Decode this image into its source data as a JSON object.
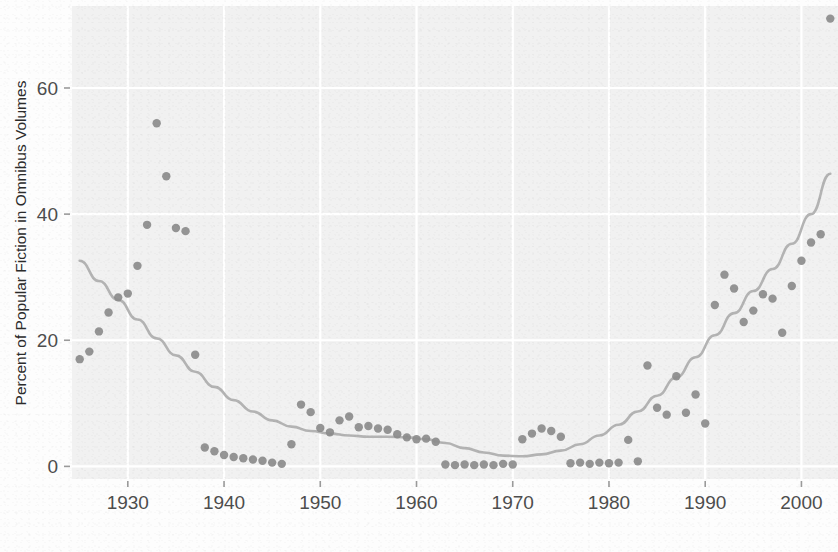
{
  "chart_data": {
    "type": "scatter",
    "title": "",
    "xlabel": "",
    "ylabel": "Percent of Popular Fiction in Omnibus Volumes",
    "xlim": [
      1924.2,
      2003.8
    ],
    "ylim": [
      -2.0,
      73.0
    ],
    "xticks": [
      1930,
      1940,
      1950,
      1960,
      1970,
      1980,
      1990,
      2000
    ],
    "xticklabels": [
      "1930",
      "1940",
      "1950",
      "1960",
      "1970",
      "1980",
      "1990",
      "2000"
    ],
    "yticks": [
      0,
      20,
      40,
      60
    ],
    "yticklabels": [
      "0",
      "20",
      "40",
      "60"
    ],
    "grid": true,
    "grid_color": "#ffffff",
    "panel_background": "#f0f0f0",
    "point_color": "#8c8c8c",
    "point_radius": 4.2,
    "legend": null,
    "series": [
      {
        "name": "Percent of popular fiction in omnibus volumes",
        "marker": "circle",
        "x": [
          1925,
          1926,
          1927,
          1928,
          1929,
          1930,
          1931,
          1932,
          1933,
          1934,
          1935,
          1936,
          1937,
          1938,
          1939,
          1940,
          1941,
          1942,
          1943,
          1944,
          1945,
          1946,
          1947,
          1948,
          1949,
          1950,
          1951,
          1952,
          1953,
          1954,
          1955,
          1956,
          1957,
          1958,
          1959,
          1960,
          1961,
          1962,
          1963,
          1964,
          1965,
          1966,
          1967,
          1968,
          1969,
          1970,
          1971,
          1972,
          1973,
          1974,
          1975,
          1976,
          1977,
          1978,
          1979,
          1980,
          1981,
          1982,
          1983,
          1984,
          1985,
          1986,
          1987,
          1988,
          1989,
          1990,
          1991,
          1992,
          1993,
          1994,
          1995,
          1996,
          1997,
          1998,
          1999,
          2000,
          2001,
          2002,
          2003
        ],
        "y": [
          17.0,
          18.2,
          21.4,
          24.4,
          26.8,
          27.4,
          31.8,
          38.3,
          54.4,
          46.0,
          37.8,
          37.3,
          17.7,
          3.0,
          2.4,
          1.8,
          1.5,
          1.3,
          1.1,
          0.9,
          0.6,
          0.4,
          3.5,
          9.8,
          8.6,
          6.1,
          5.4,
          7.3,
          7.9,
          6.2,
          6.4,
          6.0,
          5.8,
          5.1,
          4.6,
          4.3,
          4.4,
          3.9,
          0.3,
          0.2,
          0.3,
          0.2,
          0.3,
          0.2,
          0.4,
          0.3,
          4.3,
          5.2,
          6.0,
          5.6,
          4.7,
          0.5,
          0.6,
          0.4,
          0.6,
          0.5,
          0.6,
          4.2,
          0.8,
          16.0,
          9.3,
          8.2,
          14.3,
          8.5,
          11.4,
          6.8,
          25.6,
          30.4,
          28.2,
          22.9,
          24.7,
          27.3,
          26.6,
          21.2,
          28.6,
          32.6,
          35.5,
          36.8,
          71.0
        ]
      }
    ],
    "trend": {
      "name": "smoothed trend (loess)",
      "color": "#b3b3b3",
      "width": 2.6,
      "x": [
        1925,
        1927,
        1929,
        1931,
        1933,
        1935,
        1937,
        1939,
        1941,
        1943,
        1945,
        1947,
        1949,
        1951,
        1953,
        1955,
        1957,
        1959,
        1961,
        1963,
        1965,
        1967,
        1969,
        1971,
        1973,
        1975,
        1977,
        1979,
        1981,
        1983,
        1985,
        1987,
        1989,
        1991,
        1993,
        1995,
        1997,
        1999,
        2001,
        2003
      ],
      "y": [
        32.6,
        29.4,
        26.4,
        23.3,
        20.3,
        17.6,
        15.0,
        12.6,
        10.5,
        8.7,
        7.3,
        6.3,
        5.6,
        5.2,
        4.9,
        4.7,
        4.7,
        4.6,
        4.3,
        3.7,
        2.9,
        2.2,
        1.7,
        1.6,
        1.9,
        2.5,
        3.5,
        4.9,
        6.6,
        8.7,
        11.2,
        14.1,
        17.3,
        20.8,
        24.3,
        27.8,
        31.3,
        35.3,
        40.0,
        46.4
      ]
    }
  },
  "axes": {
    "y_axis_title": "Percent of Popular Fiction in Omnibus Volumes",
    "x_tick_1930": "1930",
    "x_tick_1940": "1940",
    "x_tick_1950": "1950",
    "x_tick_1960": "1960",
    "x_tick_1970": "1970",
    "x_tick_1980": "1980",
    "x_tick_1990": "1990",
    "x_tick_2000": "2000",
    "y_tick_0": "0",
    "y_tick_20": "20",
    "y_tick_40": "40",
    "y_tick_60": "60"
  }
}
